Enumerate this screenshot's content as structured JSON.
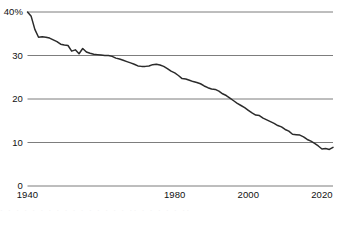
{
  "chart_data": {
    "type": "line",
    "title": "",
    "subtitle": "",
    "xlabel": "",
    "ylabel": "",
    "xlim": [
      1940,
      2023
    ],
    "ylim": [
      0,
      40
    ],
    "grid": true,
    "gridlines_y": [
      0,
      10,
      20,
      30,
      40
    ],
    "legend": "none",
    "y_tick_labels": [
      "40%",
      "30",
      "20",
      "10",
      "0"
    ],
    "y_tick_values": [
      40,
      30,
      20,
      10,
      0
    ],
    "x_tick_labels": [
      "1940",
      "1980",
      "2000",
      "2020"
    ],
    "x_tick_values": [
      1940,
      1980,
      2000,
      2020
    ],
    "series": [
      {
        "name": "share",
        "color": "#2b2b2b",
        "x": [
          1940,
          1941,
          1942,
          1943,
          1944,
          1945,
          1946,
          1947,
          1948,
          1949,
          1950,
          1951,
          1952,
          1953,
          1954,
          1955,
          1956,
          1957,
          1958,
          1959,
          1960,
          1961,
          1962,
          1963,
          1964,
          1965,
          1966,
          1967,
          1968,
          1969,
          1970,
          1971,
          1972,
          1973,
          1974,
          1975,
          1976,
          1977,
          1978,
          1979,
          1980,
          1981,
          1982,
          1983,
          1984,
          1985,
          1986,
          1987,
          1988,
          1989,
          1990,
          1991,
          1992,
          1993,
          1994,
          1995,
          1996,
          1997,
          1998,
          1999,
          2000,
          2001,
          2002,
          2003,
          2004,
          2005,
          2006,
          2007,
          2008,
          2009,
          2010,
          2011,
          2012,
          2013,
          2014,
          2015,
          2016,
          2017,
          2018,
          2019,
          2020,
          2021,
          2022,
          2023
        ],
        "values": [
          40.0,
          39.0,
          36.0,
          34.2,
          34.3,
          34.2,
          34.0,
          33.6,
          33.2,
          32.6,
          32.4,
          32.3,
          31.0,
          31.3,
          30.4,
          31.6,
          30.8,
          30.5,
          30.3,
          30.2,
          30.1,
          30.0,
          30.0,
          29.8,
          29.4,
          29.2,
          28.9,
          28.6,
          28.3,
          28.0,
          27.6,
          27.5,
          27.5,
          27.6,
          27.9,
          28.0,
          27.8,
          27.5,
          27.0,
          26.4,
          26.0,
          25.4,
          24.7,
          24.6,
          24.3,
          24.0,
          23.8,
          23.5,
          23.0,
          22.6,
          22.3,
          22.2,
          21.8,
          21.2,
          20.8,
          20.2,
          19.6,
          19.0,
          18.5,
          18.0,
          17.4,
          16.8,
          16.3,
          16.2,
          15.6,
          15.2,
          14.8,
          14.4,
          13.9,
          13.6,
          13.0,
          12.6,
          11.9,
          11.8,
          11.7,
          11.3,
          10.7,
          10.3,
          9.8,
          9.2,
          8.5,
          8.6,
          8.4,
          8.9
        ]
      }
    ]
  },
  "caption": {
    "smudge_text": "· · ·   · · ·   · ·  ·  · · ·   ·  · · ·   ·· ·   · ·  · ·   ··"
  }
}
